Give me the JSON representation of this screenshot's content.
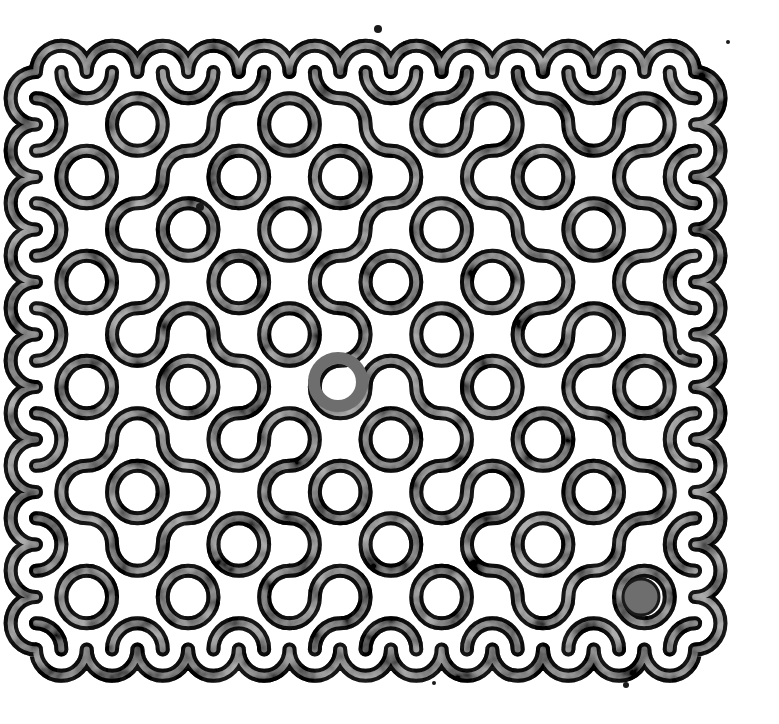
{
  "artwork": {
    "title": "Truchet-style ink tile pattern",
    "description": "Black-and-white mottled ink print of interlocking quarter-circle arc tiles forming rings, lobes and meandering paths",
    "background_color": "#ffffff",
    "ink_dark": "#1a1a1a",
    "ink_mid": "#6e6e6e",
    "ink_light": "#c8c8c8"
  },
  "grid": {
    "origin_x": 36,
    "origin_y": 72,
    "cols": 13,
    "rows": 11,
    "cell_w": 50.7,
    "cell_h": 52.5,
    "stroke_width": 12,
    "tiles": [
      "0101100110010",
      "1011010011011",
      "0110101100100",
      "1001011010011",
      "0110100101100",
      "1010011010110",
      "0101101001001",
      "1100110110100",
      "0011001011011",
      "1010110100110",
      "0101011010101"
    ]
  },
  "features": {
    "center_ring": {
      "cx": 338,
      "cy": 382,
      "r": 24
    },
    "filled_dot": {
      "cx": 641,
      "cy": 597,
      "r": 18
    },
    "specks": [
      {
        "cx": 378,
        "cy": 29,
        "r": 4
      },
      {
        "cx": 728,
        "cy": 42,
        "r": 2
      },
      {
        "cx": 680,
        "cy": 352,
        "r": 3
      },
      {
        "cx": 434,
        "cy": 683,
        "r": 2
      },
      {
        "cx": 626,
        "cy": 685,
        "r": 3
      },
      {
        "cx": 200,
        "cy": 207,
        "r": 4
      }
    ]
  }
}
